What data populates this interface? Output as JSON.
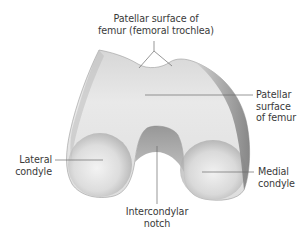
{
  "figure": {
    "colors": {
      "background": "#ffffff",
      "bone_light": "#efefef",
      "bone_mid": "#c9c9c9",
      "bone_dark": "#8e8e8e",
      "leader_line": "#6a6a6a",
      "label_text": "#3a3a3a"
    },
    "labels": {
      "patellar_surface_top": "Patellar surface of\nfemur (femoral trochlea)",
      "patellar_surface_right": "Patellar\nsurface\nof femur",
      "lateral_condyle": "Lateral\ncondyle",
      "medial_condyle": "Medial\ncondyle",
      "intercondylar_notch": "Intercondylar\nnotch"
    }
  }
}
